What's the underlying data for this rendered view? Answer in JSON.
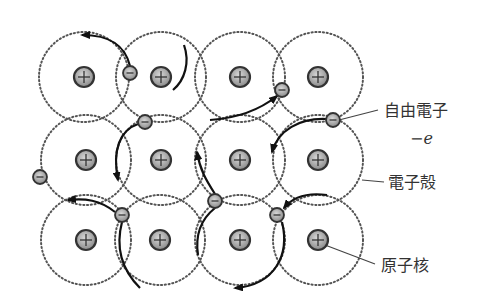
{
  "diagram": {
    "colors": {
      "shell_stroke": "#555555",
      "arrow_stroke": "#111111",
      "nucleus_fill": "#a8a8a8",
      "nucleus_stroke": "#333333",
      "electron_fill": "#b0b0b0",
      "leader_line": "#444444",
      "text": "#333333"
    },
    "shell_radius": 45,
    "nucleus_symbol": "plus",
    "electron_symbol": "minus",
    "atoms": [
      {
        "x": 84,
        "y": 77
      },
      {
        "x": 161,
        "y": 77
      },
      {
        "x": 240,
        "y": 77
      },
      {
        "x": 318,
        "y": 77
      },
      {
        "x": 86,
        "y": 160
      },
      {
        "x": 161,
        "y": 160
      },
      {
        "x": 240,
        "y": 160
      },
      {
        "x": 318,
        "y": 160
      },
      {
        "x": 86,
        "y": 240
      },
      {
        "x": 160,
        "y": 240
      },
      {
        "x": 240,
        "y": 240
      },
      {
        "x": 318,
        "y": 240
      }
    ],
    "electrons": [
      {
        "x": 130,
        "y": 73
      },
      {
        "x": 282,
        "y": 90
      },
      {
        "x": 145,
        "y": 122
      },
      {
        "x": 333,
        "y": 120
      },
      {
        "x": 40,
        "y": 177
      },
      {
        "x": 122,
        "y": 215
      },
      {
        "x": 215,
        "y": 201
      },
      {
        "x": 277,
        "y": 215
      }
    ]
  },
  "labels": {
    "free_electron": "自由電子",
    "charge": "−e",
    "electron_shell": "電子殻",
    "nucleus": "原子核"
  }
}
